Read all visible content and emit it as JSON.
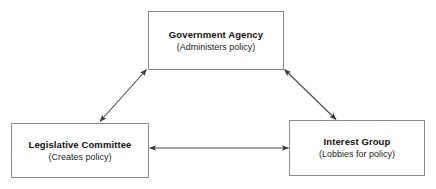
{
  "diagram": {
    "type": "triangle-relationship-diagram",
    "background_color": "#ffffff",
    "border_color": "#8a8a8a",
    "line_color": "#4a4a4a",
    "nodes": [
      {
        "id": "government-agency",
        "title": "Government Agency",
        "subtitle": "(Administers policy)",
        "position": "top-center"
      },
      {
        "id": "legislative-committee",
        "title": "Legislative Committee",
        "subtitle": "(Creates policy)",
        "position": "bottom-left"
      },
      {
        "id": "interest-group",
        "title": "Interest Group",
        "subtitle": "(Lobbies for policy)",
        "position": "bottom-right"
      }
    ],
    "connectors": [
      {
        "id": "agency-legislative-connector",
        "from": "government-agency",
        "to": "legislative-committee",
        "style": "double-headed-arrow",
        "orientation": "diagonal-left"
      },
      {
        "id": "agency-interest-connector",
        "from": "government-agency",
        "to": "interest-group",
        "style": "double-headed-arrow",
        "orientation": "diagonal-right"
      },
      {
        "id": "legislative-interest-connector",
        "from": "legislative-committee",
        "to": "interest-group",
        "style": "double-headed-arrow",
        "orientation": "horizontal"
      }
    ]
  }
}
